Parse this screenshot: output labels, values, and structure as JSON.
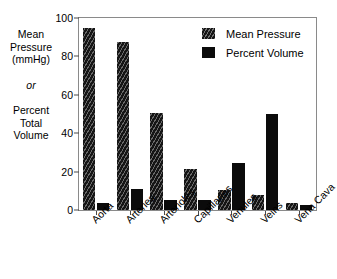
{
  "chart_data": {
    "type": "bar",
    "title": "",
    "xlabel": "",
    "ylabel": "Mean Pressure (mmHg) or Percent Total Volume",
    "ylim": [
      0,
      100
    ],
    "yticks": [
      0,
      20,
      40,
      60,
      80,
      100
    ],
    "grid": false,
    "legend_position": "top-right",
    "categories": [
      "Aorta",
      "Arteries",
      "Arterioles",
      "Capillaries",
      "Venules",
      "Veins",
      "Vena Cava"
    ],
    "series": [
      {
        "name": "Mean Pressure",
        "fill": "hatched",
        "color": "#151515",
        "values": [
          95,
          87.5,
          50.5,
          21.5,
          10.5,
          8,
          3.5
        ]
      },
      {
        "name": "Percent Volume",
        "fill": "solid",
        "color": "#0b0b0b",
        "values": [
          3.5,
          11,
          5,
          5,
          24.5,
          50,
          2.5
        ]
      }
    ]
  },
  "y_caption": {
    "line1": "Mean",
    "line2": "Pressure",
    "line3": "(mmHg)",
    "or": "or",
    "line4": "Percent",
    "line5": "Total",
    "line6": "Volume"
  },
  "legend": {
    "items": [
      {
        "label": "Mean Pressure",
        "fill": "hatched"
      },
      {
        "label": "Percent Volume",
        "fill": "solid"
      }
    ]
  },
  "axis": {
    "y_tick_labels": [
      "0",
      "20",
      "40",
      "60",
      "80",
      "100"
    ]
  }
}
